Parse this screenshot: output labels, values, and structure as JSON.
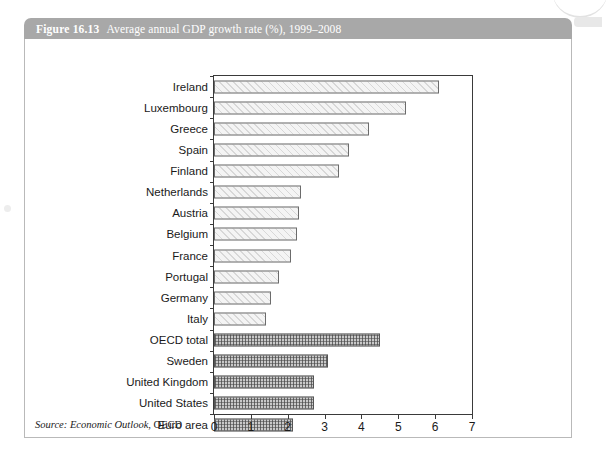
{
  "figure": {
    "number": "Figure 16.13",
    "title": "Average annual GDP growth rate (%), 1999–2008",
    "source_prefix": "Source:",
    "source_publication": "Economic Outlook",
    "source_org": ", OECD"
  },
  "colors": {
    "header_bar": "#a8a8a8",
    "header_text": "#ffffff",
    "panel_border": "#b9b9b9",
    "axis": "#3a3a3a",
    "bar_outline_country": "#6b6b6b",
    "bar_fill_country": "#f4f4f4",
    "bar_outline_aggregate": "#555555",
    "bar_fill_aggregate": "#c9c9c9"
  },
  "chart_data": {
    "type": "bar",
    "orientation": "horizontal",
    "title": "Average annual GDP growth rate (%), 1999–2008",
    "xlabel": "",
    "ylabel": "",
    "xlim": [
      0,
      7
    ],
    "xticks": [
      "0",
      "1",
      "2",
      "3",
      "4",
      "5",
      "6",
      "7"
    ],
    "grid": false,
    "legend": "none",
    "categories": [
      "Ireland",
      "Luxembourg",
      "Greece",
      "Spain",
      "Finland",
      "Netherlands",
      "Austria",
      "Belgium",
      "France",
      "Portugal",
      "Germany",
      "Italy",
      "OECD total",
      "Sweden",
      "United Kingdom",
      "United States",
      "Euro area"
    ],
    "values": [
      6.1,
      5.2,
      4.2,
      3.65,
      3.4,
      2.35,
      2.3,
      2.25,
      2.1,
      1.75,
      1.55,
      1.4,
      4.5,
      3.1,
      2.7,
      2.7,
      2.15
    ],
    "groups": [
      "country",
      "country",
      "country",
      "country",
      "country",
      "country",
      "country",
      "country",
      "country",
      "country",
      "country",
      "country",
      "aggregate",
      "aggregate",
      "aggregate",
      "aggregate",
      "aggregate"
    ]
  }
}
